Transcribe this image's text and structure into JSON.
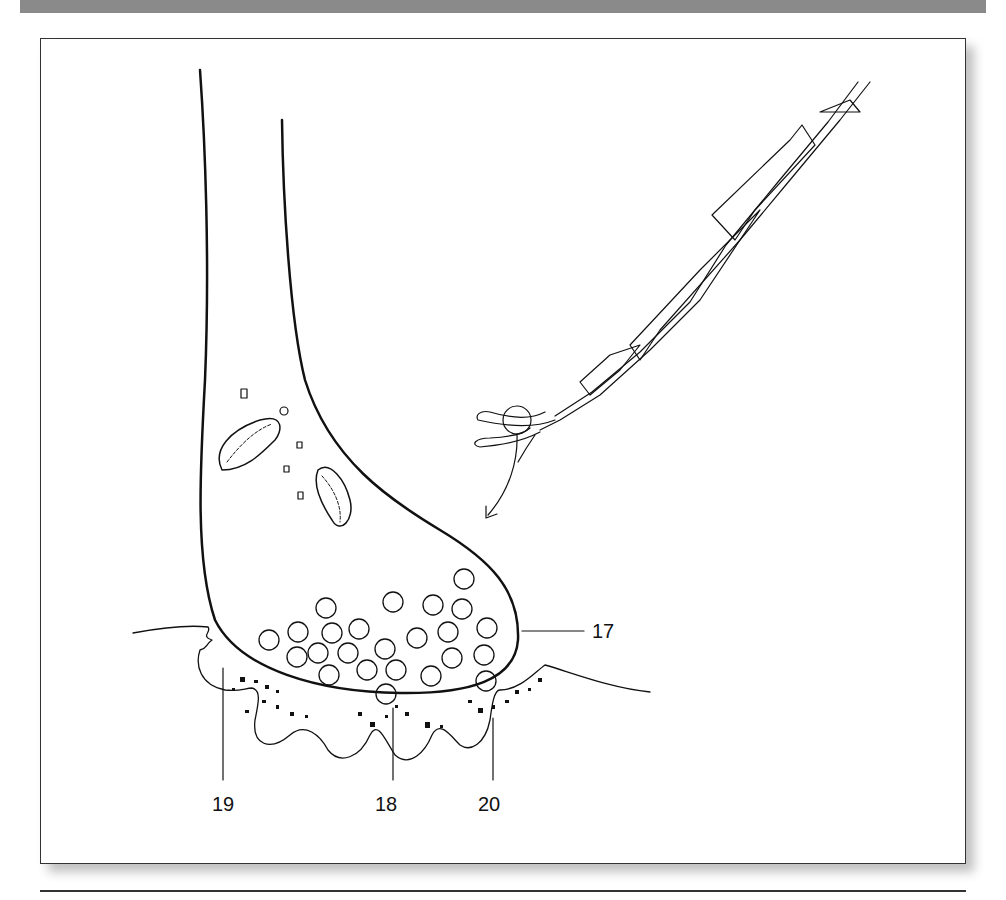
{
  "figure": {
    "labels": [
      {
        "id": "17",
        "text": "17",
        "x": 592,
        "y": 623
      },
      {
        "id": "18",
        "text": "18",
        "x": 375,
        "y": 793
      },
      {
        "id": "19",
        "text": "19",
        "x": 212,
        "y": 793
      },
      {
        "id": "20",
        "text": "20",
        "x": 478,
        "y": 793
      }
    ],
    "colors": {
      "line": "#111111",
      "band": "#8a8a8a",
      "frame": "#333333"
    }
  }
}
